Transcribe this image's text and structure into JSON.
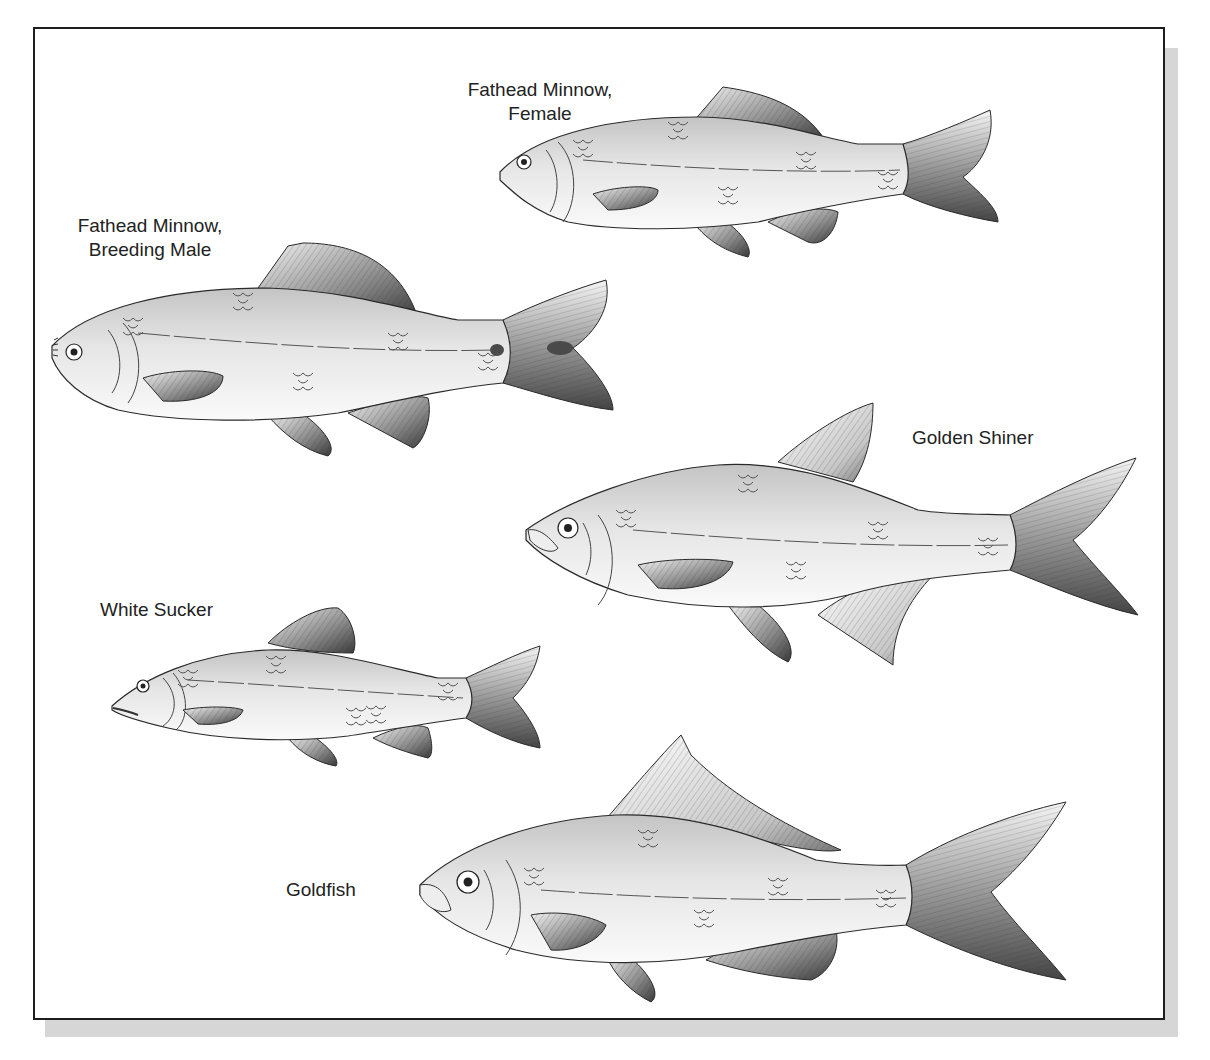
{
  "figure": {
    "labels": {
      "fathead_female": "Fathead Minnow,\nFemale",
      "fathead_male": "Fathead Minnow,\nBreeding Male",
      "golden_shiner": "Golden Shiner",
      "white_sucker": "White Sucker",
      "goldfish": "Goldfish"
    },
    "fish": [
      {
        "id": "fathead-female",
        "label_key": "fathead_female"
      },
      {
        "id": "fathead-male",
        "label_key": "fathead_male"
      },
      {
        "id": "golden-shiner",
        "label_key": "golden_shiner"
      },
      {
        "id": "white-sucker",
        "label_key": "white_sucker"
      },
      {
        "id": "goldfish",
        "label_key": "goldfish"
      }
    ],
    "colors": {
      "outline": "#2a2a2a",
      "body_light": "#f4f4f4",
      "body_mid": "#cfcfcf",
      "fin_dark": "#4a4a4a",
      "shadow": "#d6d6d6",
      "frame": "#1e1e1e"
    }
  }
}
